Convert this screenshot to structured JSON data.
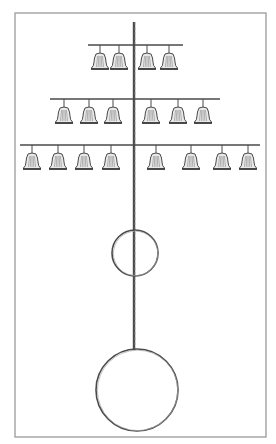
{
  "figure": {
    "colors": {
      "background": "#ffffff",
      "frame": "#9a9a9a",
      "ink": "#4a4a4a",
      "bell_shade": "#8a8a8a"
    },
    "frame": {
      "x": 15,
      "y": 13,
      "width": 251,
      "height": 424
    },
    "pole": {
      "x": 134,
      "y_top": 22,
      "y_bottom": 349
    },
    "tiers": [
      {
        "name": "top",
        "bar_y": 45,
        "bar_x1": 88,
        "bar_x2": 183,
        "bells_x": [
          100,
          119,
          147,
          169
        ],
        "bell_count": 4
      },
      {
        "name": "middle",
        "bar_y": 99,
        "bar_x1": 50,
        "bar_x2": 220,
        "bells_x": [
          64,
          89,
          113,
          151,
          178,
          203
        ],
        "bell_count": 6
      },
      {
        "name": "bottom",
        "bar_y": 145,
        "bar_x1": 20,
        "bar_x2": 260,
        "bells_x": [
          32,
          58,
          84,
          111,
          156,
          191,
          222,
          248
        ],
        "bell_count": 8
      }
    ],
    "rings": [
      {
        "name": "small-ring",
        "cx": 135,
        "cy": 253,
        "r": 23
      },
      {
        "name": "large-ring",
        "cx": 137,
        "cy": 390,
        "r": 41
      }
    ]
  }
}
